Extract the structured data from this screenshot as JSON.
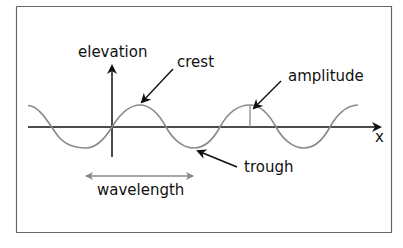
{
  "diagram": {
    "labels": {
      "vertical_axis": "elevation",
      "horizontal_axis": "x",
      "crest": "crest",
      "amplitude": "amplitude",
      "trough": "trough",
      "wavelength": "wavelength"
    },
    "colors": {
      "wave": "#8a8a8a",
      "axes": "#111111",
      "frame": "#666666",
      "wavelength_arrow": "#8a8a8a"
    }
  }
}
